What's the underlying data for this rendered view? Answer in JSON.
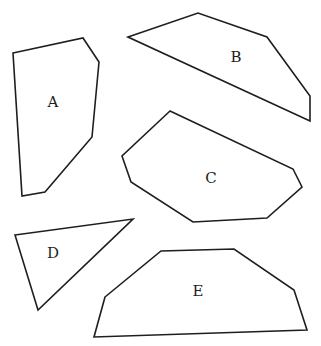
{
  "diagram": {
    "stroke_color": "#1e1e1e",
    "background": "#ffffff",
    "shapes": [
      {
        "label": "A",
        "label_pos": [
          53,
          102
        ],
        "points": "13,53 83,38 99,62 92,137 45,192 22,196"
      },
      {
        "label": "B",
        "label_pos": [
          236,
          57
        ],
        "points": "128,37 198,13 267,37 310,96 310,121"
      },
      {
        "label": "C",
        "label_pos": [
          211,
          178
        ],
        "points": "170,111 122,156 131,182 193,222 267,218 302,187 293,169"
      },
      {
        "label": "D",
        "label_pos": [
          53,
          253
        ],
        "points": "15,235 133,219 38,310"
      },
      {
        "label": "E",
        "label_pos": [
          198,
          291
        ],
        "points": "105,297 161,251 234,249 294,290 307,330 94,337"
      }
    ]
  }
}
